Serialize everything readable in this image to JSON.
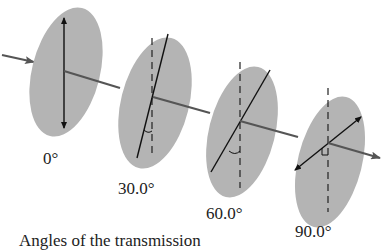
{
  "diagram": {
    "type": "polarizer-series",
    "colors": {
      "polarizer_fill": "#b4b4b4",
      "axis_line": "#555555",
      "transmission_line": "#111111",
      "text": "#222222"
    },
    "polarizers": [
      {
        "label": "0°",
        "angle_deg": 0
      },
      {
        "label": "30.0°",
        "angle_deg": 30
      },
      {
        "label": "60.0°",
        "angle_deg": 60
      },
      {
        "label": "90.0°",
        "angle_deg": 90
      }
    ],
    "caption": "Angles of the transmission"
  }
}
